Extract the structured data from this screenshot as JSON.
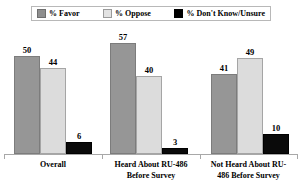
{
  "chart_data": {
    "type": "bar",
    "title": "",
    "xlabel": "",
    "ylabel": "",
    "ylim": [
      0,
      60
    ],
    "grid": false,
    "legend_position": "top",
    "categories": [
      "Overall",
      "Heard About RU-486 Before Survey",
      "Not Heard About RU-486 Before Survey"
    ],
    "series": [
      {
        "name": "% Favor",
        "color": "#969696",
        "values": [
          50,
          57,
          41
        ]
      },
      {
        "name": "% Oppose",
        "color": "#dcdcdc",
        "values": [
          44,
          40,
          49
        ]
      },
      {
        "name": "% Don't Know/Unsure",
        "color": "#0a0a0a",
        "values": [
          6,
          3,
          10
        ]
      }
    ]
  },
  "legend": {
    "entries": [
      {
        "label": "% Favor",
        "swatch": "legend-swatch-favor"
      },
      {
        "label": "% Oppose",
        "swatch": "legend-swatch-oppose"
      },
      {
        "label": "% Don't Know/Unsure",
        "swatch": "legend-swatch-dont-know"
      }
    ]
  },
  "groups": [
    {
      "label_line1": "Overall",
      "label_line2": "",
      "values": {
        "favor": "50",
        "oppose": "44",
        "dk": "6"
      }
    },
    {
      "label_line1": "Heard About RU-486",
      "label_line2": "Before Survey",
      "values": {
        "favor": "57",
        "oppose": "40",
        "dk": "3"
      }
    },
    {
      "label_line1": "Not Heard About RU-",
      "label_line2": "486 Before Survey",
      "values": {
        "favor": "41",
        "oppose": "49",
        "dk": "10"
      }
    }
  ]
}
